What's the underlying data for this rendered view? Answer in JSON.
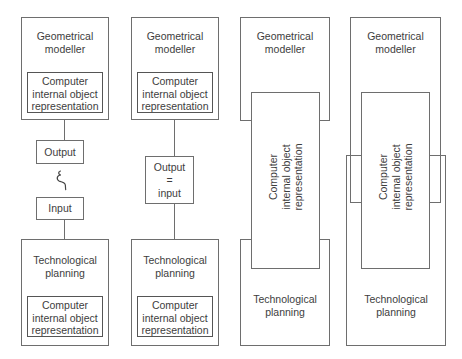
{
  "diagram": {
    "type": "block-diagram",
    "colors": {
      "line": "#6e6e6e",
      "text": "#3d3d3d",
      "background": "#ffffff"
    },
    "columns": [
      {
        "geometrical_modeller": "Geometrical\nmodeller",
        "inner_representation": "Computer\ninternal object\nrepresentation",
        "output": "Output",
        "transfer_symbol": "ξ",
        "input": "Input",
        "technological_planning": "Technological\nplanning",
        "inner_representation_2": "Computer\ninternal object\nrepresentation"
      },
      {
        "geometrical_modeller": "Geometrical\nmodeller",
        "inner_representation": "Computer\ninternal object\nrepresentation",
        "output_input": "Output\n=\ninput",
        "technological_planning": "Technological\nplanning",
        "inner_representation_2": "Computer\ninternal object\nrepresentation"
      },
      {
        "geometrical_modeller": "Geometrical\nmodeller",
        "shared_representation": "Computer\ninternal object\nrepresentation",
        "technological_planning": "Technological\nplanning"
      },
      {
        "geometrical_modeller": "Geometrical\nmodeller",
        "shared_representation": "Computer\ninternal object\nrepresentation",
        "technological_planning": "Technological\nplanning"
      }
    ]
  }
}
